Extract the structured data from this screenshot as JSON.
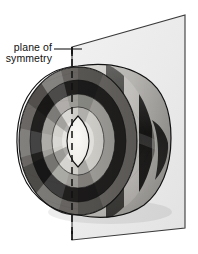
{
  "figure": {
    "kind": "geometry-illustration",
    "title_text": "",
    "background_color": "#ffffff",
    "annotation": {
      "label_line_1": "plane of",
      "label_line_2": "symmetry",
      "text_color": "#111111",
      "leader_line_color": "#1a1a1a",
      "leader_line_start_x": 54,
      "leader_line_end_x": 82,
      "leader_line_y": 49
    },
    "plane": {
      "name": "plane of symmetry",
      "fill_color": "#ebebeb",
      "edge_color": "#2b2b2b",
      "dashed_edge_color": "#111111",
      "corners": {
        "top_left_x": 72,
        "top_left_y": 47,
        "top_right_x": 185,
        "top_right_y": 15,
        "bottom_right_x": 185,
        "bottom_right_y": 228,
        "bottom_left_x": 72,
        "bottom_left_y": 240
      },
      "front_edge_style": "dashed"
    },
    "solid": {
      "name": "segmented barrel solid",
      "outline_color": "#1a1a1a",
      "center_x": 78,
      "center_y": 141,
      "front_face_radius_x": 58,
      "front_face_radius_y": 73,
      "extent_left_x": 17,
      "extent_right_x": 171,
      "extent_top_y": 66,
      "extent_bottom_y": 216,
      "core_highlight_color": "#f2f0ec",
      "ring_tones": [
        "#f0eeea",
        "#b4b2ad",
        "#6e6c68",
        "#2a2a28",
        "#8d8b86",
        "#3a3937"
      ],
      "band_tones": [
        "#d8d6d1",
        "#4a4845",
        "#111110",
        "#9b9994",
        "#252423"
      ],
      "shadow_color": "#d6d4cf"
    },
    "colors": {
      "ink": "#1a1a1a",
      "paper": "#ffffff",
      "plane_gray": "#ebebeb",
      "light_gray": "#c9c7c2",
      "mid_gray": "#7c7a76",
      "dark_gray": "#3a3937",
      "near_black": "#141413"
    }
  }
}
